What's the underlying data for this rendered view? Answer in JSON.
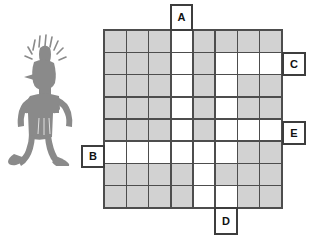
{
  "diagram": {
    "illustration": {
      "name": "petroglyph-humanoid-figure",
      "description": "Rock-art style standing humanoid with radiating rays around head",
      "color": "#8a8a8a"
    },
    "grid": {
      "columns": 8,
      "rows": 8,
      "cell_size_px": 22.5,
      "shaded_color": "#d2d2d2",
      "empty_color": "#ffffff",
      "line_color": "#4d4d4d",
      "legend": {
        "1": "shaded",
        "0": "white"
      },
      "cells": [
        [
          1,
          1,
          1,
          0,
          1,
          1,
          1,
          1
        ],
        [
          1,
          1,
          1,
          0,
          1,
          0,
          0,
          0
        ],
        [
          1,
          1,
          1,
          0,
          1,
          0,
          1,
          1
        ],
        [
          1,
          1,
          1,
          0,
          1,
          0,
          1,
          1
        ],
        [
          1,
          1,
          1,
          0,
          1,
          0,
          0,
          0
        ],
        [
          0,
          0,
          0,
          0,
          0,
          0,
          1,
          1
        ],
        [
          1,
          1,
          1,
          1,
          0,
          1,
          1,
          1
        ],
        [
          1,
          1,
          1,
          1,
          0,
          0,
          1,
          1
        ]
      ]
    },
    "labels": [
      {
        "id": "A",
        "text": "A",
        "position": "top",
        "target": "column-4"
      },
      {
        "id": "B",
        "text": "B",
        "position": "left",
        "target": "row-6"
      },
      {
        "id": "C",
        "text": "C",
        "position": "right",
        "target": "row-2"
      },
      {
        "id": "E",
        "text": "E",
        "position": "right",
        "target": "row-5"
      },
      {
        "id": "D",
        "text": "D",
        "position": "bottom",
        "target": "column-6"
      }
    ]
  }
}
